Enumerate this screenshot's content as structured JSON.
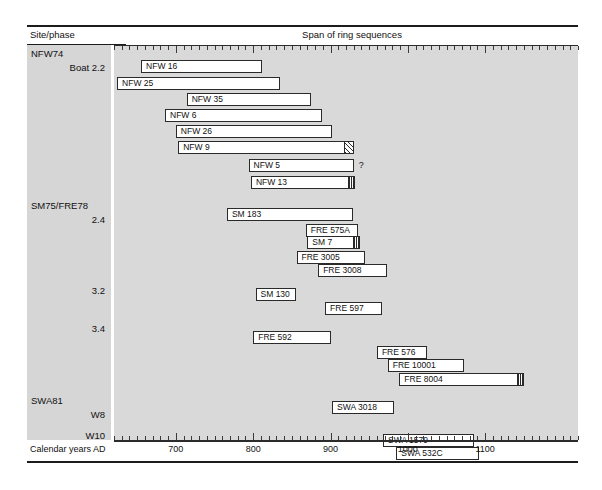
{
  "header": {
    "site_phase": "Site/phase",
    "span_title": "Span of ring sequences"
  },
  "axis": {
    "title": "Calendar years AD",
    "tick_labels": [
      "700",
      "800",
      "900",
      "1000",
      "1100"
    ],
    "tick_values": [
      700,
      800,
      900,
      1000,
      1100
    ],
    "minor_tick_step": 10,
    "range": [
      620,
      1220
    ]
  },
  "groups": [
    {
      "site": "NFW74",
      "phase": "Boat 2.2"
    },
    {
      "site": "SM75/FRE78",
      "phase": "2.4"
    },
    {
      "site": "",
      "phase": "3.2"
    },
    {
      "site": "",
      "phase": "3.4"
    },
    {
      "site": "SWA81",
      "phase": "W8"
    },
    {
      "site": "",
      "phase": "W10"
    }
  ],
  "uncertain_marker": "?",
  "chart_data": {
    "type": "bar",
    "title": "Span of ring sequences",
    "xlabel": "Calendar years AD",
    "ylabel": "Site/phase",
    "xlim": [
      620,
      1220
    ],
    "grid": false,
    "legend": "none",
    "orientation": "horizontal-ranges",
    "categories": [
      "NFW 16",
      "NFW 25",
      "NFW 35",
      "NFW 6",
      "NFW 26",
      "NFW 9",
      "NFW 5",
      "NFW 13",
      "SM 183",
      "FRE 575A",
      "SM 7",
      "FRE 3005",
      "FRE 3008",
      "SM 130",
      "FRE 597",
      "FRE 592",
      "FRE 576",
      "FRE 10001",
      "FRE 8004",
      "SWA 3018",
      "SWA 1579",
      "SWA 532C"
    ],
    "bars": [
      {
        "label": "NFW 16",
        "group": "NFW74 / Boat 2.2",
        "start": 655,
        "end": 812,
        "sapwood": false
      },
      {
        "label": "NFW 25",
        "group": "NFW74 / Boat 2.2",
        "start": 624,
        "end": 835,
        "sapwood": false
      },
      {
        "label": "NFW 35",
        "group": "NFW74 / Boat 2.2",
        "start": 714,
        "end": 875,
        "sapwood": false
      },
      {
        "label": "NFW 6",
        "group": "NFW74 / Boat 2.2",
        "start": 686,
        "end": 889,
        "sapwood": false
      },
      {
        "label": "NFW 26",
        "group": "NFW74 / Boat 2.2",
        "start": 700,
        "end": 902,
        "sapwood": false
      },
      {
        "label": "NFW 9",
        "group": "NFW74 / Boat 2.2",
        "start": 703,
        "end": 930,
        "sapwood": true
      },
      {
        "label": "NFW 5",
        "group": "NFW74 / Boat 2.2",
        "start": 794,
        "end": 930,
        "sapwood": false,
        "uncertain": true
      },
      {
        "label": "NFW 13",
        "group": "NFW74 / Boat 2.2",
        "start": 797,
        "end": 932,
        "sapwood": true
      },
      {
        "label": "SM 183",
        "group": "SM75/FRE78 / 2.4",
        "start": 766,
        "end": 929,
        "sapwood": false
      },
      {
        "label": "FRE 575A",
        "group": "SM75/FRE78 / 2.4",
        "start": 868,
        "end": 935,
        "sapwood": false
      },
      {
        "label": "SM 7",
        "group": "SM75/FRE78 / 2.4",
        "start": 870,
        "end": 938,
        "sapwood": true
      },
      {
        "label": "FRE 3005",
        "group": "SM75/FRE78 / 2.4",
        "start": 856,
        "end": 945,
        "sapwood": false
      },
      {
        "label": "FRE 3008",
        "group": "SM75/FRE78 / 2.4",
        "start": 884,
        "end": 973,
        "sapwood": false
      },
      {
        "label": "SM 130",
        "group": "3.2",
        "start": 803,
        "end": 855,
        "sapwood": false
      },
      {
        "label": "FRE 597",
        "group": "3.2",
        "start": 893,
        "end": 967,
        "sapwood": false
      },
      {
        "label": "FRE 592",
        "group": "3.4",
        "start": 800,
        "end": 901,
        "sapwood": false
      },
      {
        "label": "FRE 576",
        "group": "3.4",
        "start": 960,
        "end": 1025,
        "sapwood": false
      },
      {
        "label": "FRE 10001",
        "group": "3.4",
        "start": 974,
        "end": 1073,
        "sapwood": false
      },
      {
        "label": "FRE 8004",
        "group": "3.4",
        "start": 989,
        "end": 1150,
        "sapwood": true
      },
      {
        "label": "SWA 3018",
        "group": "SWA81 / W8",
        "start": 902,
        "end": 982,
        "sapwood": false
      },
      {
        "label": "SWA 1579",
        "group": "SWA81 / W10",
        "start": 968,
        "end": 1085,
        "sapwood": false
      },
      {
        "label": "SWA 532C",
        "group": "SWA81 / W10",
        "start": 985,
        "end": 1092,
        "sapwood": false
      }
    ]
  }
}
